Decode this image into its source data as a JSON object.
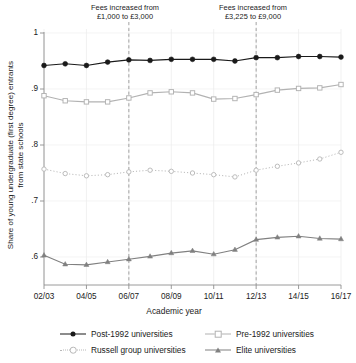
{
  "figure": {
    "ylabel": "Share of young undergraduate (first degree) entrants\nfrom state schools",
    "xlabel": "Academic year"
  },
  "annotations": [
    {
      "name": "fees-1000-3000",
      "text": "Fees increased from\n£1,000 to £3,000",
      "at_year": "06/07"
    },
    {
      "name": "fees-3225-9000",
      "text": "Fees increased from\n£3,225 to £9,000",
      "at_year": "12/13"
    }
  ],
  "legend": [
    {
      "label": "Post-1992 universities",
      "marker": "circle-filled",
      "line": "solid",
      "color": "#1a1a1a"
    },
    {
      "label": "Pre-1992 universities",
      "marker": "square-open",
      "line": "solid",
      "color": "#b2b2b2"
    },
    {
      "label": "Russell group universities",
      "marker": "circle-open",
      "line": "dotted",
      "color": "#b8b8b8"
    },
    {
      "label": "Elite universities",
      "marker": "triangle-filled",
      "line": "solid",
      "color": "#808080"
    }
  ],
  "chart_data": {
    "type": "line",
    "title": "",
    "xlabel": "Academic year",
    "ylabel": "Share of young undergraduate (first degree) entrants from state schools",
    "x": [
      "02/03",
      "03/04",
      "04/05",
      "05/06",
      "06/07",
      "07/08",
      "08/09",
      "09/10",
      "10/11",
      "11/12",
      "12/13",
      "13/14",
      "14/15",
      "15/16",
      "16/17"
    ],
    "xtick_labels": [
      "02/03",
      "04/05",
      "06/07",
      "08/09",
      "10/11",
      "12/13",
      "14/15",
      "16/17"
    ],
    "ytick_labels": [
      ".6",
      ".7",
      ".8",
      ".9",
      "1"
    ],
    "ylim": [
      0.56,
      1.01
    ],
    "yticks": [
      0.6,
      0.7,
      0.8,
      0.9,
      1.0
    ],
    "grid": "both-light",
    "legend_position": "bottom",
    "vertical_markers": [
      {
        "x": "06/07",
        "label": "Fees increased from £1,000 to £3,000",
        "style": "dashed"
      },
      {
        "x": "12/13",
        "label": "Fees increased from £3,225 to £9,000",
        "style": "dashed"
      }
    ],
    "series": [
      {
        "name": "Post-1992 universities",
        "color": "#1a1a1a",
        "marker": "circle-filled",
        "line": "solid",
        "values": [
          0.942,
          0.945,
          0.942,
          0.948,
          0.952,
          0.951,
          0.953,
          0.953,
          0.953,
          0.95,
          0.956,
          0.956,
          0.958,
          0.958,
          0.957
        ]
      },
      {
        "name": "Pre-1992 universities",
        "color": "#b2b2b2",
        "marker": "square-open",
        "line": "solid",
        "values": [
          0.888,
          0.879,
          0.877,
          0.877,
          0.884,
          0.893,
          0.895,
          0.893,
          0.882,
          0.883,
          0.89,
          0.898,
          0.901,
          0.902,
          0.908
        ]
      },
      {
        "name": "Russell group universities",
        "color": "#b8b8b8",
        "marker": "circle-open",
        "line": "dotted",
        "values": [
          0.757,
          0.749,
          0.745,
          0.747,
          0.752,
          0.755,
          0.753,
          0.75,
          0.747,
          0.743,
          0.755,
          0.762,
          0.768,
          0.775,
          0.787
        ]
      },
      {
        "name": "Elite universities",
        "color": "#808080",
        "marker": "triangle-filled",
        "line": "solid",
        "values": [
          0.603,
          0.587,
          0.586,
          0.591,
          0.596,
          0.601,
          0.607,
          0.611,
          0.605,
          0.613,
          0.631,
          0.635,
          0.637,
          0.633,
          0.632
        ]
      }
    ]
  }
}
